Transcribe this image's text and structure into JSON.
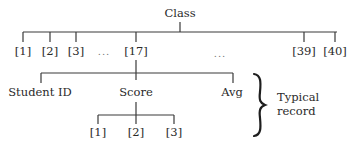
{
  "diagram": {
    "root": {
      "label": "Class"
    },
    "level1": {
      "items": [
        {
          "label": "[1]"
        },
        {
          "label": "[2]"
        },
        {
          "label": "[3]"
        },
        {
          "label": "..."
        },
        {
          "label": "[17]"
        },
        {
          "label": "..."
        },
        {
          "label": "[39]"
        },
        {
          "label": "[40]"
        }
      ]
    },
    "record": {
      "fields": [
        {
          "label": "Student ID"
        },
        {
          "label": "Score"
        },
        {
          "label": "Avg"
        }
      ],
      "score_elements": [
        {
          "label": "[1]"
        },
        {
          "label": "[2]"
        },
        {
          "label": "[3]"
        }
      ],
      "annotation": {
        "line1": "Typical",
        "line2": "record"
      }
    },
    "colors": {
      "line": "#3a3a3a",
      "text": "#2a2a2a"
    }
  }
}
